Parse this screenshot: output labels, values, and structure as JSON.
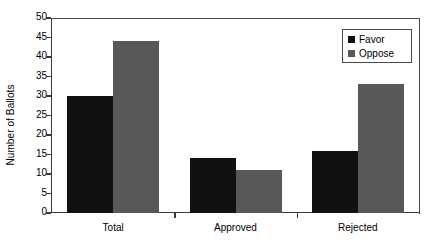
{
  "chart_data": {
    "type": "bar",
    "title": "",
    "subtitle": "",
    "xlabel": "",
    "ylabel": "Number of Ballots",
    "categories": [
      "Total",
      "Approved",
      "Rejected"
    ],
    "series": [
      {
        "name": "Favor",
        "color": "#111111",
        "values": [
          30,
          14,
          16
        ]
      },
      {
        "name": "Oppose",
        "color": "#585858",
        "values": [
          44,
          11,
          33
        ]
      }
    ],
    "ylim": [
      0,
      50
    ],
    "ytick_step": 5,
    "ytick_labels": [
      "0",
      "5",
      "10",
      "15",
      "20",
      "25",
      "30",
      "35",
      "40",
      "45",
      "50"
    ],
    "grid": false,
    "legend_position": "top-right",
    "legend_entries": [
      "Favor",
      "Oppose"
    ],
    "annotations": []
  },
  "axis": {
    "y_title": "Number of Ballots"
  },
  "legend": {
    "items": [
      {
        "label": "Favor"
      },
      {
        "label": "Oppose"
      }
    ]
  }
}
